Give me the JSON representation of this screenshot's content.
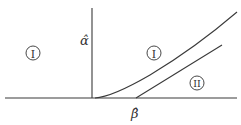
{
  "diagram": {
    "type": "phase-diagram",
    "axes": {
      "vertical_label": "α̂",
      "horizontal_label": "β̂"
    },
    "regions": [
      {
        "id": "region-left",
        "label": "I"
      },
      {
        "id": "region-upper",
        "label": "I"
      },
      {
        "id": "region-lower-right",
        "label": "II"
      }
    ],
    "curves": [
      {
        "name": "boundary-curve",
        "description": "convex curve starting at origin"
      },
      {
        "name": "tangent-line",
        "description": "straight line tangent to curve, meeting horizontal axis at β̂"
      }
    ],
    "line_color": "#3a3a3a"
  }
}
